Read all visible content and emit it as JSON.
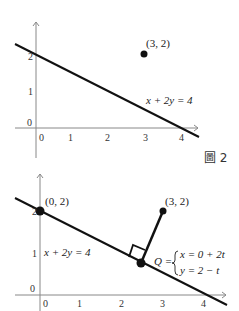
{
  "figure_label": "圖 2",
  "top": {
    "point_label": "(3, 2)",
    "line_label": "x + 2y = 4",
    "x_ticks": [
      "0",
      "1",
      "2",
      "3",
      "4"
    ],
    "y_ticks": [
      "0",
      "1",
      "2"
    ]
  },
  "bottom": {
    "point_a_label": "(0, 2)",
    "point_b_label": "(3, 2)",
    "line_label": "x + 2y = 4",
    "q_label": "Q =",
    "q_eq1": "x = 0 + 2t",
    "q_eq2": "y = 2 − t",
    "x_ticks": [
      "0",
      "1",
      "2",
      "3",
      "4"
    ],
    "y_ticks": [
      "0",
      "1",
      "2"
    ]
  },
  "colors": {
    "line": "#111111",
    "axis": "#888888"
  }
}
